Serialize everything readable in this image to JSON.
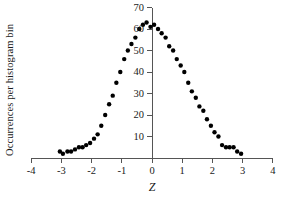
{
  "chart_data": {
    "type": "scatter",
    "title": "",
    "xlabel": "Z",
    "ylabel": "Occurrences per histogram bin",
    "xlim": [
      -4,
      4
    ],
    "ylim": [
      0,
      70
    ],
    "xticks": [
      "-4",
      "-3",
      "-2",
      "-1",
      "0",
      "1",
      "2",
      "3",
      "4"
    ],
    "xtick_values": [
      -4,
      -3,
      -2,
      -1,
      0,
      1,
      2,
      3,
      4
    ],
    "yticks": [
      "10",
      "20",
      "30",
      "40",
      "50",
      "60",
      "70"
    ],
    "ytick_values": [
      10,
      20,
      30,
      40,
      50,
      60,
      70
    ],
    "grid": false,
    "legend": null,
    "marker": "filled-circle",
    "marker_color": "#000000",
    "marker_size_px": 2.2,
    "axis_color": "#555555",
    "x": [
      -3.05,
      -2.95,
      -2.8,
      -2.68,
      -2.55,
      -2.42,
      -2.3,
      -2.18,
      -2.05,
      -1.92,
      -1.8,
      -1.68,
      -1.55,
      -1.42,
      -1.3,
      -1.18,
      -1.05,
      -0.92,
      -0.8,
      -0.68,
      -0.55,
      -0.42,
      -0.3,
      -0.18,
      -0.05,
      0.07,
      0.2,
      0.32,
      0.45,
      0.57,
      0.7,
      0.82,
      0.95,
      1.07,
      1.2,
      1.32,
      1.45,
      1.57,
      1.7,
      1.82,
      1.95,
      2.07,
      2.2,
      2.32,
      2.45,
      2.57,
      2.7,
      2.82,
      2.95
    ],
    "y": [
      3,
      2,
      3,
      3,
      4,
      5,
      5,
      6,
      7,
      9,
      11,
      15,
      20,
      25,
      29,
      35,
      40,
      46,
      50,
      53,
      56,
      60,
      62,
      63,
      61,
      62,
      60,
      58,
      56,
      52,
      50,
      46,
      43,
      40,
      35,
      31,
      28,
      24,
      22,
      18,
      15,
      12,
      10,
      6,
      5,
      5,
      5,
      3,
      2
    ]
  }
}
